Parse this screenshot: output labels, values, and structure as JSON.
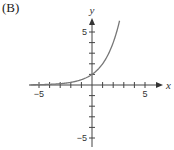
{
  "panel_label": "(B)",
  "chart_data": {
    "type": "line",
    "title": "",
    "xlabel": "x",
    "ylabel": "y",
    "xlim": [
      -6,
      6
    ],
    "ylim": [
      -6,
      6
    ],
    "xticks": [
      -5,
      -4,
      -3,
      -2,
      -1,
      0,
      1,
      2,
      3,
      4,
      5
    ],
    "yticks": [
      -5,
      -4,
      -3,
      -2,
      -1,
      0,
      1,
      2,
      3,
      4,
      5
    ],
    "tick_labels": {
      "x_neg": "−5",
      "x_pos": "5",
      "y_pos": "5",
      "y_neg": "−5"
    },
    "grid": false,
    "series": [
      {
        "name": "y = 2^x",
        "x": [
          -5,
          -4,
          -3,
          -2,
          -1,
          0,
          1,
          1.5,
          2,
          2.6
        ],
        "y": [
          0.03,
          0.06,
          0.13,
          0.25,
          0.5,
          1,
          2,
          2.83,
          4,
          6.06
        ],
        "color": "#777777"
      }
    ]
  }
}
